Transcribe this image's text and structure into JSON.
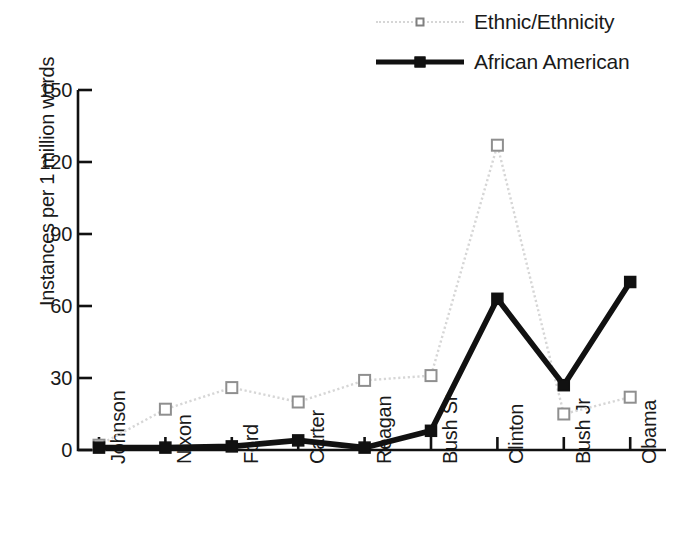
{
  "chart_data": {
    "type": "line",
    "title": "",
    "xlabel": "",
    "ylabel": "Instances per 1 million words",
    "categories": [
      "Johnson",
      "Nixon",
      "Ford",
      "Carter",
      "Reagan",
      "Bush Sr",
      "Clinton",
      "Bush Jr",
      "Obama"
    ],
    "ylim": [
      0,
      150
    ],
    "yticks": [
      0,
      30,
      60,
      90,
      120,
      150
    ],
    "grid": false,
    "legend_position": "top-right",
    "series": [
      {
        "name": "Ethnic/Ethnicity",
        "color": "#d6d6d6",
        "marker": "open-square",
        "line_style": "dotted",
        "values": [
          2,
          17,
          26,
          20,
          29,
          31,
          127,
          15,
          22
        ]
      },
      {
        "name": "African American",
        "color": "#111111",
        "marker": "filled-square",
        "line_style": "solid",
        "values": [
          1,
          1,
          1.5,
          4,
          1,
          8,
          63,
          27,
          70
        ]
      }
    ]
  },
  "legend": {
    "items": [
      {
        "label": "Ethnic/Ethnicity",
        "swatch": "dotted-line-open-square"
      },
      {
        "label": "African American",
        "swatch": "solid-line-filled-square"
      }
    ]
  },
  "axes": {
    "y_title": "Instances per 1 million words",
    "y_ticks": [
      "0",
      "30",
      "60",
      "90",
      "120",
      "150"
    ],
    "x_ticks": [
      "Johnson",
      "Nixon",
      "Ford",
      "Carter",
      "Reagan",
      "Bush Sr",
      "Clinton",
      "Bush Jr",
      "Obama"
    ]
  }
}
